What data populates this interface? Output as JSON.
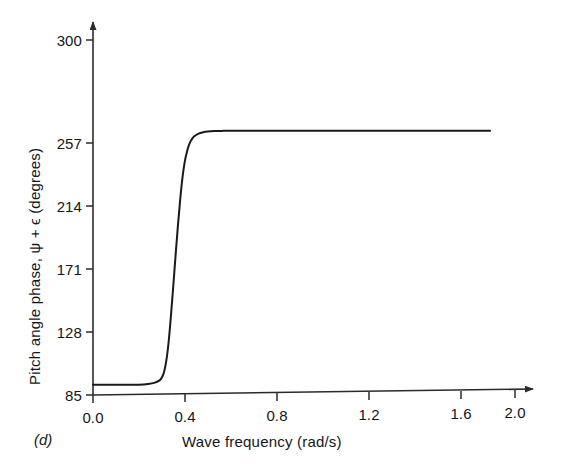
{
  "figure": {
    "panel_label": "(d)",
    "background_color": "#ffffff",
    "line_color": "#1a1a1a",
    "axis_color": "#2b2b2b"
  },
  "chart_data": {
    "type": "line",
    "title": "",
    "subtitle": "",
    "xlabel": "Wave frequency (rad/s)",
    "ylabel": "Pitch angle phase, ψ + ϵ (degrees)",
    "xlim": [
      0.0,
      2.0
    ],
    "ylim": [
      85,
      300
    ],
    "xticks": [
      "0.0",
      "0.4",
      "0.8",
      "1.2",
      "1.6",
      "2.0"
    ],
    "xtick_values": [
      0.0,
      0.4,
      0.8,
      1.2,
      1.6,
      2.0
    ],
    "yticks": [
      "85",
      "128",
      "171",
      "214",
      "257",
      "300"
    ],
    "ytick_values": [
      85,
      128,
      171,
      214,
      257,
      300
    ],
    "grid": false,
    "legend": null,
    "annotations": [
      "(d)"
    ],
    "series": [
      {
        "name": "Pitch angle phase",
        "x": [
          0.0,
          0.05,
          0.1,
          0.15,
          0.2,
          0.24,
          0.27,
          0.29,
          0.3,
          0.31,
          0.32,
          0.33,
          0.34,
          0.35,
          0.36,
          0.37,
          0.38,
          0.39,
          0.4,
          0.41,
          0.42,
          0.43,
          0.44,
          0.46,
          0.48,
          0.5,
          0.53,
          0.56,
          0.6,
          0.65,
          0.7,
          0.8,
          0.9,
          1.0,
          1.2,
          1.4,
          1.6,
          1.73
        ],
        "y": [
          92,
          92,
          92,
          92,
          92,
          92.5,
          93.5,
          95,
          97,
          101,
          109,
          122,
          140,
          160,
          181,
          201,
          219,
          234,
          245,
          252,
          257,
          260,
          262,
          264,
          265,
          265.5,
          265.8,
          265.9,
          266,
          266,
          266,
          266,
          266,
          266,
          266,
          266,
          266,
          266
        ]
      }
    ]
  },
  "axes_geometry": {
    "x_pixel_origin": 93,
    "x_pixel_per_unit": 229.5,
    "y_pixel_origin": 395,
    "y_pixel_per_unit": 1.46
  }
}
